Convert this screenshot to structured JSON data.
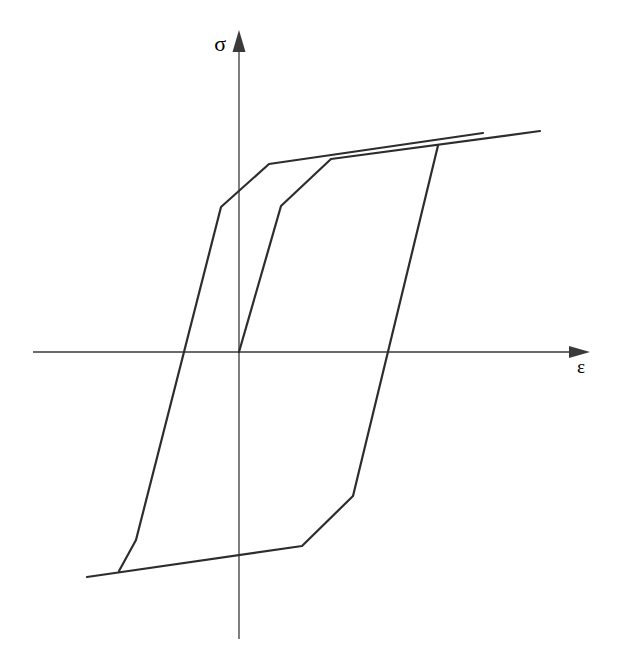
{
  "figure": {
    "background": "#ffffff",
    "curve_color": "#2d2d2d",
    "axis_color": "#3a3a3a",
    "curve_width": 2.2,
    "axis_width": 1.3,
    "axes": {
      "y_axis": {
        "label": "σ",
        "x": 239,
        "top": 48,
        "bottom": 639,
        "arrow_tip_y": 30,
        "arrow_base_y": 52,
        "arrow_half_width": 6.5
      },
      "x_axis": {
        "label": "ε",
        "y": 352,
        "left": 33,
        "right": 578,
        "arrow_tip_x": 590,
        "arrow_base_x": 569,
        "arrow_half_height": 6
      }
    },
    "curves": [
      {
        "name": "initial-loading",
        "points": [
          [
            239,
            352
          ],
          [
            281,
            206
          ],
          [
            331,
            159
          ],
          [
            540,
            131
          ]
        ]
      },
      {
        "name": "unloading-compression",
        "points": [
          [
            438,
            145.5
          ],
          [
            353,
            496
          ],
          [
            302,
            546
          ],
          [
            87,
            577
          ]
        ]
      },
      {
        "name": "reloading-tension",
        "points": [
          [
            119,
            571
          ],
          [
            136,
            540
          ],
          [
            221,
            207
          ],
          [
            269,
            164
          ],
          [
            483,
            133
          ]
        ]
      }
    ]
  },
  "chart_data": {
    "type": "line",
    "title": "",
    "xlabel": "ε",
    "ylabel": "σ",
    "grid": false,
    "legend": "none",
    "series_names": [
      "initial-loading",
      "unloading-compression",
      "reloading-tension"
    ]
  }
}
